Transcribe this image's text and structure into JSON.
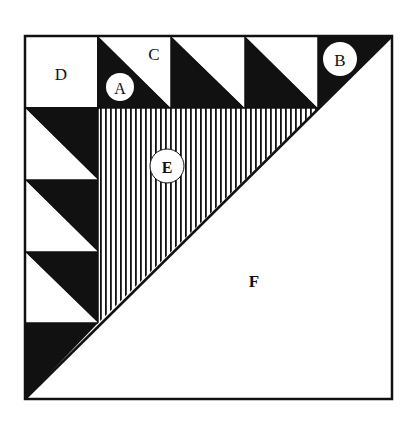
{
  "diagram": {
    "title": "",
    "type": "quilt-block-layout",
    "colors": {
      "ink": "#111111",
      "paper": "#ffffff"
    },
    "labels": {
      "A": "A",
      "B": "B",
      "C": "C",
      "D": "D",
      "E": "E",
      "F": "F"
    },
    "regions": [
      {
        "id": "A",
        "description": "dark half-square triangle in top row",
        "fill": "dark",
        "circled": true
      },
      {
        "id": "B",
        "description": "dark corner triangle at top-right",
        "fill": "dark",
        "circled": true
      },
      {
        "id": "C",
        "description": "light half-square triangle in top row",
        "fill": "light",
        "circled": false
      },
      {
        "id": "D",
        "description": "plain square at top-left corner",
        "fill": "light",
        "circled": false
      },
      {
        "id": "E",
        "description": "large striped triangle",
        "fill": "vertical-stripes",
        "circled": true
      },
      {
        "id": "F",
        "description": "large plain triangle lower-right half",
        "fill": "light",
        "circled": false
      }
    ],
    "top_row_units": 3,
    "left_column_units": 3
  }
}
